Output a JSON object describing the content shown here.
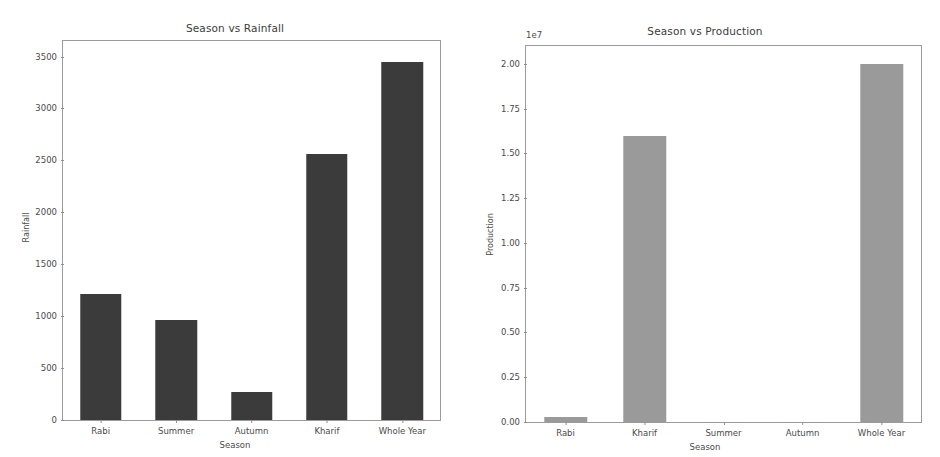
{
  "figure": {
    "width": 940,
    "height": 457,
    "background": "#ffffff"
  },
  "chart_data": [
    {
      "id": "season-vs-rainfall",
      "type": "bar",
      "title": "Season vs Rainfall",
      "xlabel": "Season",
      "ylabel": "Rainfall",
      "categories": [
        "Rabi",
        "Summer",
        "Autumn",
        "Kharif",
        "Whole Year"
      ],
      "values": [
        1210,
        960,
        270,
        2560,
        3450
      ],
      "ylim": [
        0,
        3650
      ],
      "yticks": [
        0,
        500,
        1000,
        1500,
        2000,
        2500,
        3000,
        3500
      ],
      "ytick_labels": [
        "0",
        "500",
        "1000",
        "1500",
        "2000",
        "2500",
        "3000",
        "3500"
      ],
      "offset_text": "",
      "bar_color": "#3b3b3b",
      "grid": false,
      "legend": "none"
    },
    {
      "id": "season-vs-production",
      "type": "bar",
      "title": "Season vs Production",
      "xlabel": "Season",
      "ylabel": "Production",
      "categories": [
        "Rabi",
        "Kharif",
        "Summer",
        "Autumn",
        "Whole Year"
      ],
      "values": [
        300000,
        16000000,
        20000,
        15000,
        20000000
      ],
      "ylim": [
        0,
        21000000
      ],
      "yticks": [
        0,
        2500000,
        5000000,
        7500000,
        10000000,
        12500000,
        15000000,
        17500000,
        20000000
      ],
      "ytick_labels": [
        "0.00",
        "0.25",
        "0.50",
        "0.75",
        "1.00",
        "1.25",
        "1.50",
        "1.75",
        "2.00"
      ],
      "offset_text": "1e7",
      "bar_color": "#9a9a9a",
      "grid": false,
      "legend": "none"
    }
  ]
}
